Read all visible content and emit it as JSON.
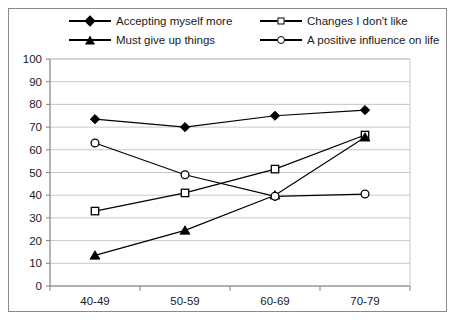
{
  "chart_data": {
    "type": "line",
    "title": "",
    "subtitle": "",
    "xlabel": "",
    "ylabel": "",
    "categories": [
      "40-49",
      "50-59",
      "60-69",
      "70-79"
    ],
    "ylim": [
      0,
      100
    ],
    "yticks": [
      0,
      10,
      20,
      30,
      40,
      50,
      60,
      70,
      80,
      90,
      100
    ],
    "grid": true,
    "legend_position": "top",
    "series": [
      {
        "name": "Accepting myself more",
        "marker": "filled-diamond",
        "values": [
          73.5,
          70,
          75,
          77.5
        ]
      },
      {
        "name": "Changes I don't like",
        "marker": "open-square",
        "values": [
          33,
          41,
          51.5,
          66.5
        ]
      },
      {
        "name": "Must give up things",
        "marker": "filled-triangle",
        "values": [
          13.5,
          24.5,
          40,
          65.5
        ]
      },
      {
        "name": "A positive influence on life",
        "marker": "open-circle",
        "values": [
          63,
          49,
          39.5,
          40.5
        ]
      }
    ],
    "colors": {
      "line": "#000000",
      "grid": "#c8c8c8",
      "axis": "#808080",
      "background": "#ffffff",
      "border": "#8a8a8a"
    }
  }
}
